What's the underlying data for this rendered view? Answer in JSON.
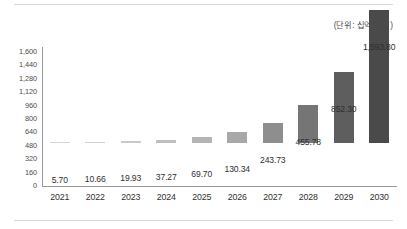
{
  "caption": {
    "unit_note": "(단위: 십억 달러)"
  },
  "chart_data": {
    "type": "bar",
    "title": "",
    "subtitle": "",
    "xlabel": "",
    "ylabel": "",
    "unit_note": "(단위: 십억 달러)",
    "grid": false,
    "legend": "none",
    "ylim": [
      0,
      1600
    ],
    "y_ticks": [
      0,
      160,
      320,
      480,
      640,
      800,
      960,
      1120,
      1280,
      1440,
      1600
    ],
    "y_tick_labels": [
      "0",
      "160",
      "320",
      "480",
      "640",
      "800",
      "960",
      "1,120",
      "1,280",
      "1,440",
      "1,600"
    ],
    "categories": [
      "2021",
      "2022",
      "2023",
      "2024",
      "2025",
      "2026",
      "2027",
      "2028",
      "2029",
      "2030"
    ],
    "values": [
      5.7,
      10.66,
      19.93,
      37.27,
      69.7,
      130.34,
      243.73,
      455.78,
      852.3,
      1593.8
    ],
    "value_labels": [
      "5.70",
      "10.66",
      "19.93",
      "37.27",
      "69.70",
      "130.34",
      "243.73",
      "455.78",
      "852.30",
      "1,593.80"
    ],
    "bar_colors": [
      "#d6d6d6",
      "#d2d2d2",
      "#c9c9c9",
      "#bfbfbf",
      "#b4b4b4",
      "#a8a8a8",
      "#8e8e8e",
      "#757575",
      "#5e5e5e",
      "#4a4a4a"
    ],
    "colors": {
      "axis": "#9a9a9e",
      "rule": "#d8d8dc",
      "text": "#2f2f2f",
      "tick_text": "#4d4d4d",
      "background": "#ffffff"
    }
  }
}
